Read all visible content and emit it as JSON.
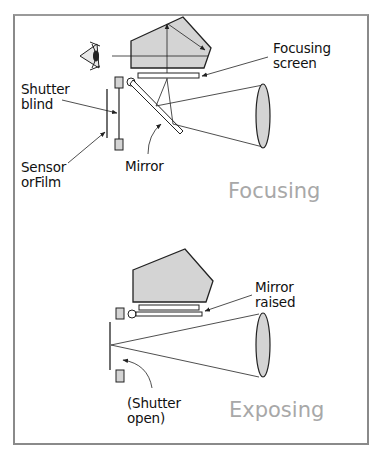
{
  "diagram": {
    "type": "SLR camera mechanism",
    "panels": [
      {
        "mode_label": "Focusing",
        "labels": {
          "focusing_screen": "Focusing\nscreen",
          "shutter_blind": "Shutter\nblind",
          "sensor": "Sensor\norFilm",
          "mirror": "Mirror"
        }
      },
      {
        "mode_label": "Exposing",
        "labels": {
          "mirror_raised": "Mirror\nraised",
          "shutter_open": "(Shutter\nopen)"
        }
      }
    ],
    "colors": {
      "fill": "#d4d4d4",
      "stroke": "#222222",
      "mode_text": "#a8a8a8",
      "frame": "#8a8a8a"
    }
  }
}
